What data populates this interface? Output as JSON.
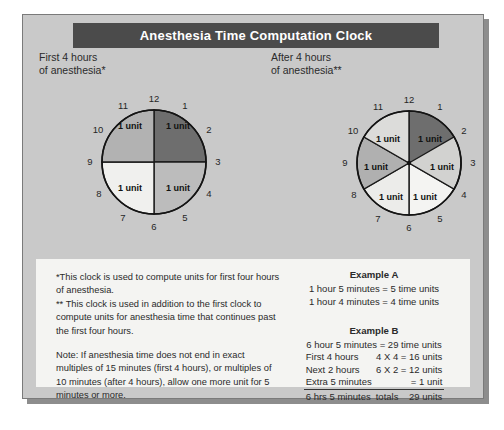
{
  "poster": {
    "title": "Anesthesia Time Computation Clock"
  },
  "clocks": [
    {
      "name": "first-four-hours-clock",
      "caption": "First 4 hours\nof anesthesia*",
      "segments": 4,
      "segment_label": "1 unit",
      "dial_numbers": [
        "12",
        "1",
        "2",
        "3",
        "4",
        "5",
        "6",
        "7",
        "8",
        "9",
        "10",
        "11"
      ],
      "segment_colors": [
        "#6e6e6e",
        "#bcbcbc",
        "#f0f0ee",
        "#b2b2b2"
      ]
    },
    {
      "name": "after-four-hours-clock",
      "caption": "After 4 hours\nof anesthesia**",
      "segments": 6,
      "segment_label": "1 unit",
      "dial_numbers": [
        "12",
        "1",
        "2",
        "3",
        "4",
        "5",
        "6",
        "7",
        "8",
        "9",
        "10",
        "11"
      ],
      "segment_colors": [
        "#6e6e6e",
        "#d2d2d0",
        "#f4f4f2",
        "#dcdcda",
        "#b0b0b0",
        "#ececea"
      ]
    }
  ],
  "notes": {
    "footnote_single": "*This clock is used to compute units for first four hours of anesthesia.",
    "footnote_double": "** This clock is used in addition to the first clock to compute units for anesthesia time that continues past the first four hours.",
    "note": "Note: If anesthesia time does not end in exact multiples of 15 minutes (first 4 hours), or multiples of 10 minutes (after 4 hours), allow one more unit for 5 minutes or more."
  },
  "example_a": {
    "title": "Example A",
    "lines": [
      "1 hour 5 minutes = 5 time units",
      "1 hour 4 minutes = 4 time units"
    ]
  },
  "example_b": {
    "title": "Example B",
    "header": "6 hour 5 minutes = 29 time units",
    "rows": [
      {
        "label": "First 4 hours",
        "value": "4 X 4 = 16 units"
      },
      {
        "label": "Next 2 hours",
        "value": "6 X 2 = 12 units"
      },
      {
        "label": "Extra 5 minutes",
        "value": "= 1 unit"
      }
    ],
    "total": {
      "label": "6 hrs 5 minutes",
      "word": "totals",
      "value": "29 units"
    }
  },
  "colors": {
    "banner": "#4b4b4b",
    "card": "#c9c9c9",
    "panel": "#f4f4f2"
  }
}
